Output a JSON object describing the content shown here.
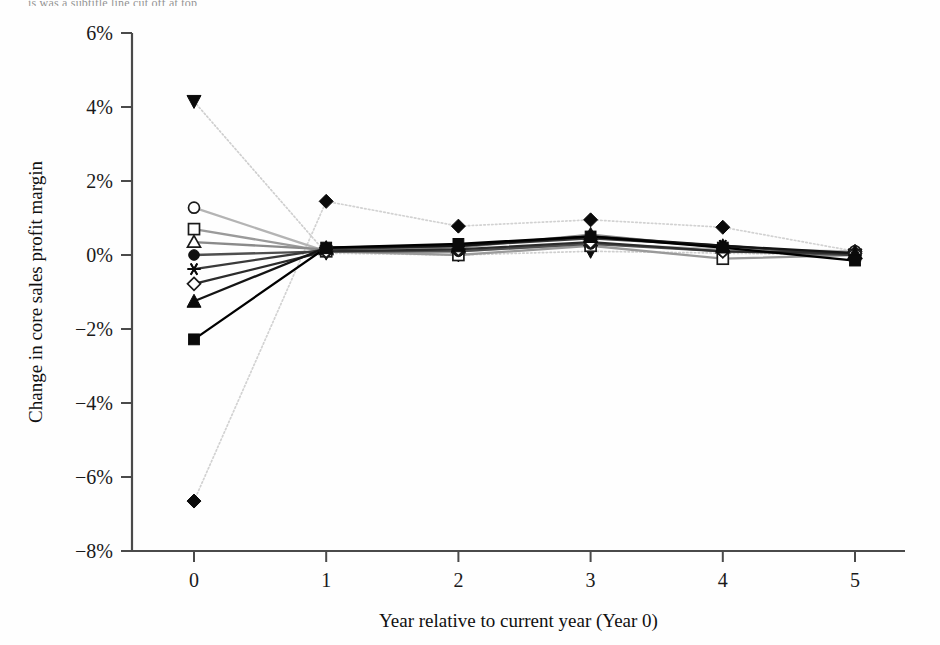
{
  "caption_fragment": "is was a subtitle line cut off at top",
  "chart_data": {
    "type": "line",
    "title": "",
    "xlabel": "Year relative to current year (Year 0)",
    "ylabel": "Change in core sales profit margin",
    "x": [
      0,
      1,
      2,
      3,
      4,
      5
    ],
    "xticklabels": [
      "0",
      "1",
      "2",
      "3",
      "4",
      "5"
    ],
    "yticklabels": [
      "6%",
      "4%",
      "2%",
      "0%",
      "-2%",
      "-4%",
      "-6%",
      "-8%"
    ],
    "yticks": [
      6,
      4,
      2,
      0,
      -2,
      -4,
      -6,
      -8
    ],
    "xlim": [
      -0.35,
      5.35
    ],
    "ylim": [
      -8,
      6
    ],
    "grid": false,
    "legend": "none",
    "units": "percent",
    "series": [
      {
        "name": "series-filled-down-triangle",
        "marker": "filled-down-triangle",
        "color": "#cfcfcf",
        "linestyle": "dotted",
        "values": [
          4.15,
          0.05,
          0.0,
          0.1,
          0.05,
          0.0
        ]
      },
      {
        "name": "series-filled-diamond",
        "marker": "filled-diamond",
        "color": "#d2d2d2",
        "linestyle": "dotted",
        "values": [
          -6.65,
          1.45,
          0.78,
          0.95,
          0.75,
          0.1
        ]
      },
      {
        "name": "series-open-circle",
        "marker": "open-circle",
        "color": "#b4b4b4",
        "linestyle": "solid",
        "values": [
          1.28,
          0.1,
          0.1,
          0.3,
          0.15,
          0.1
        ]
      },
      {
        "name": "series-open-square",
        "marker": "open-square",
        "color": "#9a9a9a",
        "linestyle": "solid",
        "values": [
          0.7,
          0.1,
          0.0,
          0.25,
          -0.1,
          0.0
        ]
      },
      {
        "name": "series-open-triangle",
        "marker": "open-triangle",
        "color": "#8a8a8a",
        "linestyle": "solid",
        "values": [
          0.35,
          0.15,
          0.2,
          0.55,
          0.2,
          0.05
        ]
      },
      {
        "name": "series-filled-circle",
        "marker": "filled-circle",
        "color": "#4f4f4f",
        "linestyle": "solid",
        "values": [
          0.0,
          0.1,
          0.1,
          0.3,
          0.1,
          0.0
        ]
      },
      {
        "name": "series-asterisk",
        "marker": "asterisk",
        "color": "#3a3a3a",
        "linestyle": "solid",
        "values": [
          -0.38,
          0.15,
          0.25,
          0.45,
          0.25,
          0.0
        ]
      },
      {
        "name": "series-open-diamond",
        "marker": "open-diamond",
        "color": "#2c2c2c",
        "linestyle": "solid",
        "values": [
          -0.78,
          0.1,
          0.15,
          0.35,
          0.1,
          0.05
        ]
      },
      {
        "name": "series-filled-triangle",
        "marker": "filled-triangle",
        "color": "#141414",
        "linestyle": "solid",
        "values": [
          -1.25,
          0.2,
          0.25,
          0.5,
          0.25,
          0.05
        ]
      },
      {
        "name": "series-filled-square",
        "marker": "filled-square",
        "color": "#000000",
        "linestyle": "solid",
        "values": [
          -2.28,
          0.2,
          0.3,
          0.5,
          0.2,
          -0.15
        ]
      }
    ]
  }
}
